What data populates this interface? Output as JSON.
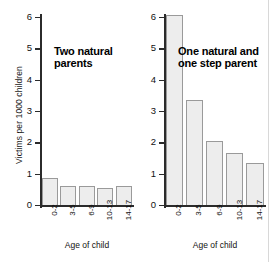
{
  "chart_data": {
    "type": "bar",
    "title": "",
    "xlabel": "Age of child",
    "ylabel": "Victims per 1000 children",
    "ylim": [
      0,
      6
    ],
    "yticks": [
      "0",
      "1",
      "2",
      "3",
      "4",
      "5",
      "6"
    ],
    "categories": [
      "0-2",
      "3-5",
      "6-9",
      "10-13",
      "14-17"
    ],
    "grid": false,
    "legend": "none",
    "bar_fill_color": "#ededed",
    "bar_edge_color": "#9a9a9a",
    "axis_color": "#2b2b2b",
    "panels": [
      {
        "name": "two-natural-parents",
        "title": "Two natural\nparents",
        "values": [
          0.85,
          0.62,
          0.6,
          0.55,
          0.62
        ]
      },
      {
        "name": "one-natural-one-step-parent",
        "title": "One natural and\none step parent",
        "values": [
          6.05,
          3.35,
          2.03,
          1.65,
          1.35
        ]
      }
    ]
  }
}
